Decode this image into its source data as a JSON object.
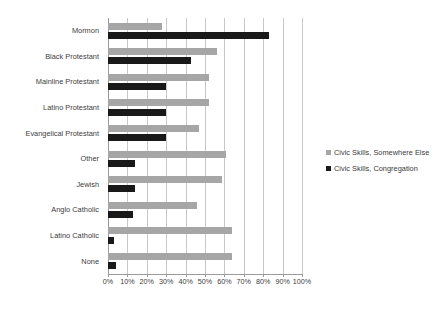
{
  "chart_data": {
    "type": "bar",
    "orientation": "horizontal",
    "title": "",
    "subtitle": "",
    "xlabel": "",
    "ylabel": "",
    "xlim": [
      0,
      100
    ],
    "x_tick_labels": [
      "0%",
      "10%",
      "20%",
      "30%",
      "40%",
      "50%",
      "60%",
      "70%",
      "80%",
      "90%",
      "100%"
    ],
    "x_tick_values": [
      0,
      10,
      20,
      30,
      40,
      50,
      60,
      70,
      80,
      90,
      100
    ],
    "grid": true,
    "legend_position": "right",
    "categories": [
      "Mormon",
      "Black Protestant",
      "Mainline Protestant",
      "Latino Protestant",
      "Evangelical Protestant",
      "Other",
      "Jewish",
      "Anglo Catholic",
      "Latino Catholic",
      "None"
    ],
    "series": [
      {
        "name": "Civic Skills, Somewhere Else",
        "color": "#a6a6a6",
        "values": [
          28,
          56,
          52,
          52,
          47,
          61,
          59,
          46,
          64,
          64
        ]
      },
      {
        "name": "Civic Skills, Congregation",
        "color": "#191919",
        "values": [
          83,
          43,
          30,
          30,
          30,
          14,
          14,
          13,
          3,
          4
        ]
      }
    ]
  },
  "legend": {
    "items": [
      {
        "label": "Civic Skills, Somewhere Else",
        "swatch": "else"
      },
      {
        "label": "Civic Skills, Congregation",
        "swatch": "cong"
      }
    ]
  }
}
